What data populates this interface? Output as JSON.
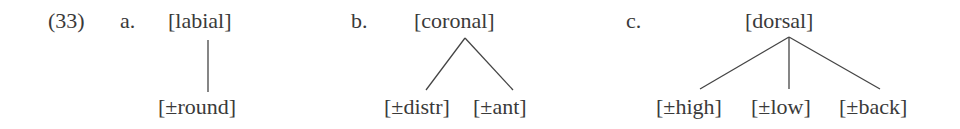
{
  "example_number": "(33)",
  "trees": [
    {
      "label": "a.",
      "root": "[labial]",
      "children": [
        "[±round]"
      ]
    },
    {
      "label": "b.",
      "root": "[coronal]",
      "children": [
        "[±distr]",
        "[±ant]"
      ]
    },
    {
      "label": "c.",
      "root": "[dorsal]",
      "children": [
        "[±high]",
        "[±low]",
        "[±back]"
      ]
    }
  ],
  "colors": {
    "text": "#3a3a3a",
    "lines": "#444444",
    "background": "#ffffff"
  }
}
